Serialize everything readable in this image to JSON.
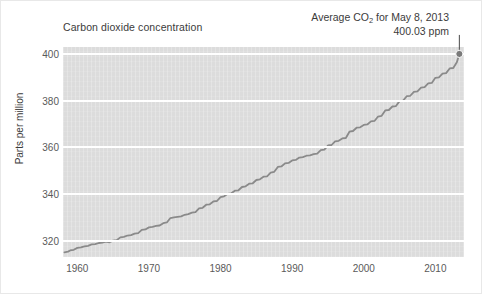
{
  "chart_data": {
    "type": "line",
    "title": "Carbon dioxide concentration",
    "xlabel": "",
    "ylabel": "Parts per million",
    "xlim": [
      1958,
      2014
    ],
    "ylim": [
      313,
      403
    ],
    "grid": true,
    "legend_position": "none",
    "plot_background_color": "#dcdcdc",
    "gridline_color": "#ffffff",
    "line_color": "#8a8a8a",
    "marker_color": "#7a7a7a",
    "text_color": "#3b3b3b",
    "tick_color": "#5a5a5a",
    "xticks": [
      "1960",
      "1970",
      "1980",
      "1990",
      "2000",
      "2010"
    ],
    "xtick_values": [
      1960,
      1970,
      1980,
      1990,
      2000,
      2010
    ],
    "yticks": [
      "320",
      "340",
      "360",
      "380",
      "400"
    ],
    "ytick_values": [
      320,
      340,
      360,
      380,
      400
    ],
    "annotation": {
      "line1_pre": "Average CO",
      "line1_sub": "2",
      "line1_post": " for May 8, 2013",
      "line2": "400.03 ppm",
      "point_x": 2013.35,
      "point_y": 400.03
    },
    "series": [
      {
        "name": "Mauna Loa CO2 (monthly mean)",
        "x": [
          1958.2,
          1958.7,
          1959.0,
          1959.5,
          1960.0,
          1960.5,
          1961.0,
          1961.5,
          1962.0,
          1962.5,
          1963.0,
          1963.5,
          1964.0,
          1964.5,
          1965.0,
          1965.5,
          1966.0,
          1966.5,
          1967.0,
          1967.5,
          1968.0,
          1968.5,
          1969.0,
          1969.5,
          1970.0,
          1970.5,
          1971.0,
          1971.5,
          1972.0,
          1972.5,
          1973.0,
          1973.5,
          1974.0,
          1974.5,
          1975.0,
          1975.5,
          1976.0,
          1976.5,
          1977.0,
          1977.5,
          1978.0,
          1978.5,
          1979.0,
          1979.5,
          1980.0,
          1980.5,
          1981.0,
          1981.5,
          1982.0,
          1982.5,
          1983.0,
          1983.5,
          1984.0,
          1984.5,
          1985.0,
          1985.5,
          1986.0,
          1986.5,
          1987.0,
          1987.5,
          1988.0,
          1988.5,
          1989.0,
          1989.5,
          1990.0,
          1990.5,
          1991.0,
          1991.5,
          1992.0,
          1992.5,
          1993.0,
          1993.5,
          1994.0,
          1994.5,
          1995.0,
          1995.5,
          1996.0,
          1996.5,
          1997.0,
          1997.5,
          1998.0,
          1998.5,
          1999.0,
          1999.5,
          2000.0,
          2000.5,
          2001.0,
          2001.5,
          2002.0,
          2002.5,
          2003.0,
          2003.5,
          2004.0,
          2004.5,
          2005.0,
          2005.5,
          2006.0,
          2006.5,
          2007.0,
          2007.5,
          2008.0,
          2008.5,
          2009.0,
          2009.5,
          2010.0,
          2010.5,
          2011.0,
          2011.5,
          2012.0,
          2012.5,
          2013.0,
          2013.35
        ],
        "y": [
          315.0,
          315.3,
          315.8,
          316.1,
          316.9,
          317.1,
          317.6,
          317.8,
          318.4,
          318.5,
          319.0,
          319.2,
          319.6,
          319.3,
          320.0,
          320.2,
          321.4,
          321.6,
          322.2,
          322.4,
          323.0,
          323.2,
          324.6,
          324.8,
          325.7,
          325.9,
          326.3,
          326.5,
          327.5,
          327.8,
          329.7,
          330.0,
          330.2,
          330.4,
          331.1,
          331.4,
          332.0,
          332.2,
          333.8,
          334.1,
          335.4,
          335.6,
          336.8,
          337.0,
          338.7,
          339.0,
          340.1,
          340.3,
          341.4,
          341.6,
          343.0,
          343.3,
          344.4,
          344.6,
          346.0,
          346.3,
          347.4,
          347.6,
          349.2,
          349.5,
          351.6,
          351.8,
          353.1,
          353.3,
          354.4,
          354.6,
          355.6,
          355.8,
          356.4,
          356.6,
          357.1,
          357.3,
          358.8,
          359.0,
          360.8,
          361.0,
          362.6,
          362.8,
          363.8,
          364.0,
          366.7,
          367.0,
          368.4,
          368.6,
          369.6,
          369.8,
          371.1,
          371.3,
          373.2,
          373.5,
          375.8,
          376.0,
          377.5,
          377.7,
          379.8,
          380.0,
          381.9,
          382.1,
          383.8,
          384.0,
          385.6,
          385.8,
          387.4,
          387.6,
          389.8,
          390.0,
          391.6,
          391.8,
          393.8,
          394.0,
          396.5,
          400.03
        ]
      }
    ]
  }
}
